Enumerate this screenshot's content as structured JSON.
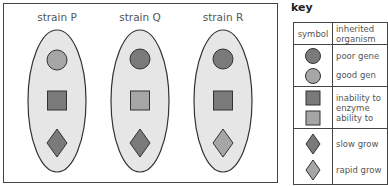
{
  "colors": {
    "dark_fill": "#7a7a7a",
    "light_fill": "#a6a6a6",
    "ellipse_fill": "#e6e6e6",
    "outline": "#333333"
  },
  "strains": [
    {
      "label": "strain P",
      "circle": "light",
      "square": "dark",
      "diamond": "dark"
    },
    {
      "label": "strain Q",
      "circle": "dark",
      "square": "light",
      "diamond": "dark"
    },
    {
      "label": "strain R",
      "circle": "dark",
      "square": "dark",
      "diamond": "light"
    }
  ],
  "key": {
    "title": "key",
    "header": {
      "symbol": "symbol",
      "description_line1": "inherited",
      "description_line2": "organism"
    },
    "groups": [
      {
        "shape": "circle",
        "rows": [
          {
            "shade": "dark",
            "text": "poor gene"
          },
          {
            "shade": "light",
            "text": "good gen"
          }
        ]
      },
      {
        "shape": "square",
        "rows": [
          {
            "shade": "dark",
            "text": "inability to",
            "text2": "enzyme"
          },
          {
            "shade": "light",
            "text": "ability to"
          }
        ]
      },
      {
        "shape": "diamond",
        "rows": [
          {
            "shade": "dark",
            "text": "slow grow"
          },
          {
            "shade": "light",
            "text": "rapid grow"
          }
        ]
      }
    ]
  }
}
